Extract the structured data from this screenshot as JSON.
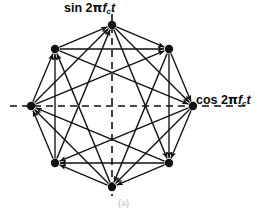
{
  "figure": {
    "title_axis_vertical": "sin 2πfᴄt",
    "title_axis_horizontal": "cos 2πfᴄt",
    "caption": "(a)",
    "ink_color": "#111111",
    "background_color": "#ffffff"
  },
  "labels": {
    "sin": {
      "func": "sin",
      "coef": "2",
      "pi": "π",
      "carrier": "f",
      "sub": "c",
      "time": "t"
    },
    "cos": {
      "func": "cos",
      "coef": "2",
      "pi": "π",
      "carrier": "f",
      "sub": "c",
      "time": "t"
    }
  },
  "chart_data": {
    "type": "scatter",
    "xlabel": "cos 2πfᴄt",
    "ylabel": "sin 2πfᴄt",
    "grid": false,
    "legend": "none",
    "axes": {
      "style": "dashed-crosshair",
      "center": [
        112,
        106
      ],
      "x_extent": [
        10,
        250
      ],
      "y_extent": [
        14,
        196
      ],
      "xlim": [
        -1.3,
        1.3
      ],
      "ylim": [
        -1.3,
        1.3
      ]
    },
    "geometry": {
      "center_x": 112,
      "center_y": 106,
      "radius": 81,
      "point_count": 8,
      "start_angle_deg": 90,
      "angle_step_deg": 45,
      "dot_radius": 4.2
    },
    "points": [
      {
        "index": 0,
        "label": "",
        "angle_deg": 90,
        "x": 0.0,
        "y": 1.0,
        "px": 112,
        "py": 25
      },
      {
        "index": 1,
        "label": "",
        "angle_deg": 45,
        "x": 0.707,
        "y": 0.707,
        "px": 169,
        "py": 49
      },
      {
        "index": 2,
        "label": "",
        "angle_deg": 0,
        "x": 1.0,
        "y": 0.0,
        "px": 193,
        "py": 106
      },
      {
        "index": 3,
        "label": "",
        "angle_deg": 315,
        "x": 0.707,
        "y": -0.707,
        "px": 169,
        "py": 163
      },
      {
        "index": 4,
        "label": "",
        "angle_deg": 270,
        "x": 0.0,
        "y": -1.0,
        "px": 112,
        "py": 187
      },
      {
        "index": 5,
        "label": "",
        "angle_deg": 225,
        "x": -0.707,
        "y": -0.707,
        "px": 55,
        "py": 163
      },
      {
        "index": 6,
        "label": "",
        "angle_deg": 180,
        "x": -1.0,
        "y": 0.0,
        "px": 31,
        "py": 106
      },
      {
        "index": 7,
        "label": "",
        "angle_deg": 135,
        "x": -0.707,
        "y": 0.707,
        "px": 55,
        "py": 49
      }
    ],
    "transitions": {
      "description": "bidirectional (double-headed) arrows between constellation states",
      "chord_steps": [
        1,
        2,
        3
      ],
      "pairs": [
        [
          0,
          1
        ],
        [
          1,
          2
        ],
        [
          2,
          3
        ],
        [
          3,
          4
        ],
        [
          4,
          5
        ],
        [
          5,
          6
        ],
        [
          6,
          7
        ],
        [
          7,
          0
        ],
        [
          0,
          2
        ],
        [
          1,
          3
        ],
        [
          2,
          4
        ],
        [
          3,
          5
        ],
        [
          4,
          6
        ],
        [
          5,
          7
        ],
        [
          6,
          0
        ],
        [
          7,
          1
        ],
        [
          0,
          3
        ],
        [
          1,
          4
        ],
        [
          2,
          5
        ],
        [
          3,
          6
        ],
        [
          4,
          7
        ],
        [
          5,
          0
        ],
        [
          6,
          1
        ],
        [
          7,
          2
        ]
      ]
    }
  }
}
